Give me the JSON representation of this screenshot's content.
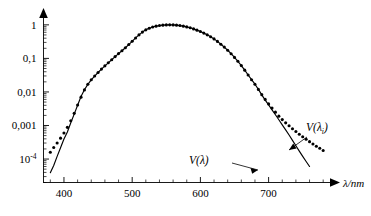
{
  "chart_data": {
    "type": "line",
    "title": "",
    "subtitle": "",
    "xlabel": "λ/nm",
    "ylabel": "",
    "xlim": [
      370,
      790
    ],
    "ylim_log": [
      2e-05,
      1.6
    ],
    "y_scale": "log",
    "grid": false,
    "legend_position": "inline-annotation",
    "x_ticks": [
      400,
      500,
      600,
      700
    ],
    "x_tick_labels": [
      "400",
      "500",
      "600",
      "700"
    ],
    "x_minor_tick_step": 20,
    "y_ticks": [
      1,
      0.1,
      0.01,
      0.001,
      0.0001
    ],
    "y_tick_labels": [
      "1",
      "0,1",
      "0,01",
      "10⁻⁴"
    ],
    "y_tick_label_0001": "0,001",
    "y_tick_label_1e4_mantissa": "10",
    "y_tick_label_1e4_exponent": "-4",
    "annotations": [
      {
        "name": "solid-curve-label",
        "text": "V(λ)",
        "base": "V",
        "arg": "λ",
        "x": 700,
        "y": 0.00022
      },
      {
        "name": "dotted-curve-label",
        "text": "V(λᵢ)",
        "base": "V",
        "arg": "λ",
        "sub": "i",
        "x": 757,
        "y": 0.0035
      }
    ],
    "series": [
      {
        "name": "V(λ)",
        "style": "solid-line",
        "color": "#000000",
        "x": [
          380,
          385,
          390,
          395,
          400,
          405,
          410,
          415,
          420,
          425,
          430,
          435,
          440,
          445,
          450,
          455,
          460,
          465,
          470,
          475,
          480,
          485,
          490,
          495,
          500,
          505,
          510,
          515,
          520,
          525,
          530,
          535,
          540,
          545,
          550,
          555,
          560,
          565,
          570,
          575,
          580,
          585,
          590,
          595,
          600,
          605,
          610,
          615,
          620,
          625,
          630,
          635,
          640,
          645,
          650,
          655,
          660,
          665,
          670,
          675,
          680,
          685,
          690,
          695,
          700,
          705,
          710,
          715,
          720,
          725,
          730,
          735,
          740,
          745,
          750,
          755,
          760
        ],
        "y": [
          3.9e-05,
          6.4e-05,
          0.00012,
          0.000217,
          0.000396,
          0.00064,
          0.00121,
          0.00218,
          0.004,
          0.0073,
          0.0116,
          0.01684,
          0.023,
          0.0298,
          0.038,
          0.048,
          0.06,
          0.0739,
          0.091,
          0.1126,
          0.139,
          0.1693,
          0.208,
          0.2586,
          0.323,
          0.4073,
          0.503,
          0.6082,
          0.71,
          0.7932,
          0.862,
          0.9149,
          0.954,
          0.9803,
          0.995,
          1.0,
          0.995,
          0.9786,
          0.952,
          0.9154,
          0.87,
          0.8163,
          0.757,
          0.6949,
          0.631,
          0.5668,
          0.503,
          0.4412,
          0.381,
          0.321,
          0.265,
          0.217,
          0.175,
          0.1382,
          0.107,
          0.0816,
          0.061,
          0.04458,
          0.032,
          0.0232,
          0.017,
          0.01192,
          0.00821,
          0.005723,
          0.004102,
          0.002929,
          0.002091,
          0.001484,
          0.001047,
          0.00074,
          0.00052,
          0.000361,
          0.000249,
          0.000172,
          0.00012,
          8.48e-05,
          6e-05
        ]
      },
      {
        "name": "V(λᵢ)",
        "style": "dotted-markers",
        "color": "#000000",
        "x": [
          380,
          385,
          390,
          395,
          400,
          405,
          410,
          415,
          420,
          425,
          430,
          435,
          440,
          445,
          450,
          455,
          460,
          465,
          470,
          475,
          480,
          485,
          490,
          495,
          500,
          505,
          510,
          515,
          520,
          525,
          530,
          535,
          540,
          545,
          550,
          555,
          560,
          565,
          570,
          575,
          580,
          585,
          590,
          595,
          600,
          605,
          610,
          615,
          620,
          625,
          630,
          635,
          640,
          645,
          650,
          655,
          660,
          665,
          670,
          675,
          680,
          685,
          690,
          695,
          700,
          705,
          710,
          715,
          720,
          725,
          730,
          735,
          740,
          745,
          750,
          755,
          760,
          765,
          770,
          775,
          780
        ],
        "y": [
          0.00016,
          0.00022,
          0.0003,
          0.00042,
          0.0006,
          0.00088,
          0.00138,
          0.0023,
          0.0041,
          0.007,
          0.0115,
          0.017,
          0.0232,
          0.03,
          0.038,
          0.048,
          0.06,
          0.074,
          0.091,
          0.113,
          0.139,
          0.169,
          0.208,
          0.259,
          0.323,
          0.407,
          0.503,
          0.608,
          0.71,
          0.793,
          0.862,
          0.915,
          0.954,
          0.98,
          0.995,
          1.0,
          0.995,
          0.978,
          0.952,
          0.915,
          0.87,
          0.816,
          0.757,
          0.695,
          0.631,
          0.567,
          0.503,
          0.441,
          0.381,
          0.321,
          0.265,
          0.217,
          0.175,
          0.138,
          0.107,
          0.082,
          0.061,
          0.0446,
          0.032,
          0.0232,
          0.017,
          0.0119,
          0.0083,
          0.006,
          0.0044,
          0.0033,
          0.0025,
          0.0019,
          0.0015,
          0.0012,
          0.00098,
          0.0008,
          0.00066,
          0.00055,
          0.00046,
          0.00039,
          0.00033,
          0.00028,
          0.00024,
          0.00021,
          0.00018
        ]
      }
    ]
  },
  "axes": {
    "y_axis_name": "log-luminous-efficiency-axis",
    "x_axis_name": "wavelength-axis",
    "x_axis_arrow": true,
    "y_axis_arrow": true
  }
}
